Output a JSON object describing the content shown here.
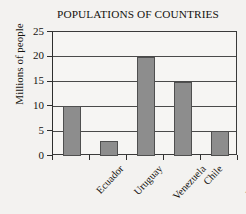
{
  "chart_data": {
    "type": "bar",
    "title": "POPULATIONS OF COUNTRIES",
    "xlabel": "",
    "ylabel": "Millions of people",
    "categories": [
      "Ecuador",
      "Uruguay",
      "Venezuela",
      "Chile",
      "Paraguay"
    ],
    "values": [
      10,
      3,
      20,
      15,
      5
    ],
    "ylim": [
      0,
      25
    ],
    "ytick_labels": [
      "0",
      "5",
      "10",
      "15",
      "20",
      "25"
    ],
    "ytick_values": [
      0,
      5,
      10,
      15,
      20,
      25
    ],
    "grid": "horizontal",
    "legend": "none",
    "bar_color": "#8d8d8d",
    "bar_edge_color": "#4f4f4f",
    "axis_color": "#2e2e2e",
    "background_color": "#f3f2f0"
  }
}
